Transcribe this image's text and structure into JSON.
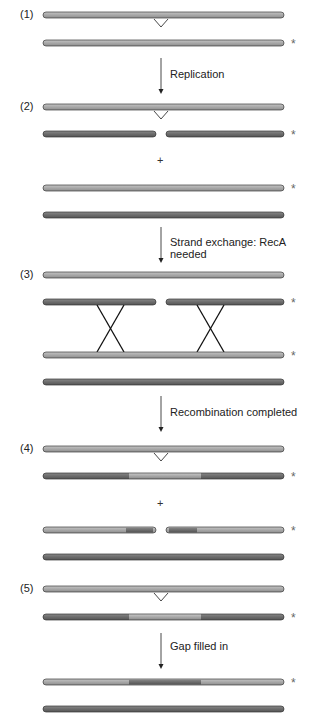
{
  "diagram": {
    "colors": {
      "light_strand": "#acacac",
      "dark_strand": "#6e6e6e",
      "outline": "#3a3a3a",
      "crossover": "#111111",
      "text": "#222222"
    },
    "steps": [
      {
        "label": "(1)",
        "y": 15
      },
      {
        "label": "(2)",
        "y": 107
      },
      {
        "label": "(3)",
        "y": 275
      },
      {
        "label": "(4)",
        "y": 449
      },
      {
        "label": "(5)",
        "y": 589
      }
    ],
    "arrows": [
      {
        "label": "Replication",
        "y1": 58,
        "y2": 94,
        "text_y": 69
      },
      {
        "label": "Strand exchange: RecA needed",
        "y1": 227,
        "y2": 263,
        "text_y": 236
      },
      {
        "label": "Recombination completed",
        "y1": 396,
        "y2": 432,
        "text_y": 407
      },
      {
        "label": "Gap filled in",
        "y1": 633,
        "y2": 669,
        "text_y": 642
      }
    ],
    "plus_signs": [
      {
        "symbol": "+",
        "y": 154
      },
      {
        "symbol": "+",
        "y": 497
      }
    ],
    "asterisks": [
      {
        "symbol": "*",
        "y": 37
      },
      {
        "symbol": "*",
        "y": 128
      },
      {
        "symbol": "*",
        "y": 182
      },
      {
        "symbol": "*",
        "y": 296
      },
      {
        "symbol": "*",
        "y": 349
      },
      {
        "symbol": "*",
        "y": 470
      },
      {
        "symbol": "*",
        "y": 524
      },
      {
        "symbol": "*",
        "y": 611
      },
      {
        "symbol": "*",
        "y": 676
      }
    ],
    "gap_marker_x": 161,
    "crossovers": [
      {
        "x_top_left": 97,
        "x_top_right": 124,
        "y_top": 302,
        "y_bottom": 355
      },
      {
        "x_top_left": 197,
        "x_top_right": 224,
        "y_top": 302,
        "y_bottom": 355
      }
    ]
  }
}
